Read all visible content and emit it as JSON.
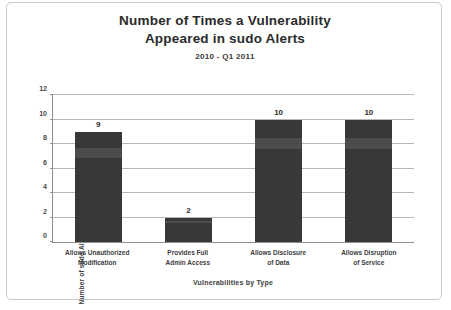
{
  "chart_data": {
    "type": "bar",
    "title": "Number of Times a Vulnerability Appeared in sudo Alerts",
    "title_lines": [
      "Number of Times a Vulnerability",
      "Appeared in sudo Alerts"
    ],
    "subtitle": "2010 - Q1 2011",
    "xlabel": "Vulnerabilities by Type",
    "ylabel": "Number of sudo Alerts",
    "categories": [
      "Allows Unauthorized Modification",
      "Provides Full Admin Access",
      "Allows Disclosure of Data",
      "Allows Disruption of Service"
    ],
    "category_lines": [
      [
        "Allows Unauthorized",
        "Modification"
      ],
      [
        "Provides Full",
        "Admin Access"
      ],
      [
        "Allows Disclosure",
        "of Data"
      ],
      [
        "Allows Disruption",
        "of Service"
      ]
    ],
    "values": [
      9,
      2,
      10,
      10
    ],
    "value_labels": [
      "9",
      "2",
      "10",
      "10"
    ],
    "ylim": [
      0,
      12
    ],
    "yticks": [
      0,
      2,
      4,
      6,
      8,
      10,
      12
    ],
    "ytick_labels": [
      "0",
      "2",
      "4",
      "6",
      "8",
      "10",
      "12"
    ],
    "grid": true,
    "legend": false,
    "bar_color": "#383838",
    "grid_color": "#b6b6b6",
    "axis_color": "#8d8d8d",
    "frame_color": "#c8c8c8",
    "background_color": "#ffffff"
  }
}
